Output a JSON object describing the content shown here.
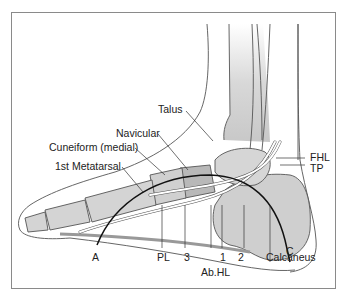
{
  "figure": {
    "type": "anatomical-illustration",
    "labels": {
      "talus": "Talus",
      "navicular": "Navicular",
      "cuneiform": "Cuneiform (medial)",
      "metatarsal": "1st Metatarsal",
      "fhl": "FHL",
      "tp": "TP",
      "a": "A",
      "pl": "PL",
      "three": "3",
      "one": "1",
      "two": "2",
      "abhl": "Ab.HL",
      "calcaneus": "Calcaneus",
      "c": "C"
    },
    "colors": {
      "frame": "#8a8a8a",
      "outline": "#555555",
      "bone_fill": "#d4d4d4",
      "bone_dark": "#b0b0b0",
      "arch_line": "#1a1a1a",
      "tendon": "#ffffff"
    }
  }
}
